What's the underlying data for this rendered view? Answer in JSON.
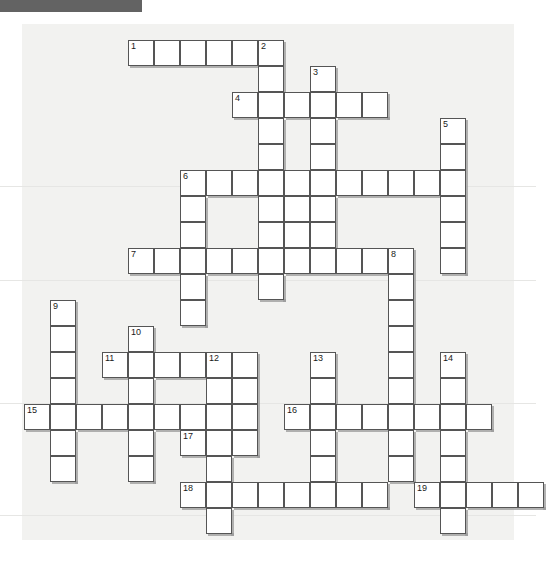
{
  "page": {
    "background_color": "#ffffff",
    "board_background_color": "#f2f2f0",
    "cell_fill_color": "#ffffff",
    "cell_border_color": "#555555",
    "header_bar_color": "#636363"
  },
  "grid": {
    "cell_size_px": 26,
    "origin_x_px": 24,
    "origin_y_px": 40,
    "columns": 20,
    "rows": 19,
    "total_clue_numbers": 19
  },
  "entries": [
    {
      "number": "1",
      "direction": "across",
      "col": 4,
      "row": 0,
      "length": 6
    },
    {
      "number": "2",
      "direction": "down",
      "col": 9,
      "row": 0,
      "length": 10
    },
    {
      "number": "3",
      "direction": "down",
      "col": 11,
      "row": 1,
      "length": 6
    },
    {
      "number": "4",
      "direction": "across",
      "col": 8,
      "row": 2,
      "length": 6
    },
    {
      "number": "5",
      "direction": "down",
      "col": 16,
      "row": 3,
      "length": 6
    },
    {
      "number": "6",
      "direction": "across",
      "col": 6,
      "row": 5,
      "length": 11
    },
    {
      "number": "7",
      "direction": "across",
      "col": 4,
      "row": 8,
      "length": 10
    },
    {
      "number": "8",
      "direction": "down",
      "col": 14,
      "row": 8,
      "length": 7
    },
    {
      "number": "9",
      "direction": "down",
      "col": 1,
      "row": 10,
      "length": 7
    },
    {
      "number": "10",
      "direction": "down",
      "col": 4,
      "row": 11,
      "length": 7
    },
    {
      "number": "11",
      "direction": "across",
      "col": 3,
      "row": 12,
      "length": 6
    },
    {
      "number": "12",
      "direction": "down",
      "col": 7,
      "row": 12,
      "length": 7
    },
    {
      "number": "13",
      "direction": "down",
      "col": 11,
      "row": 12,
      "length": 6
    },
    {
      "number": "14",
      "direction": "down",
      "col": 16,
      "row": 12,
      "length": 7
    },
    {
      "number": "15",
      "direction": "across",
      "col": 0,
      "row": 14,
      "length": 7
    },
    {
      "number": "16",
      "direction": "across",
      "col": 10,
      "row": 14,
      "length": 8
    },
    {
      "number": "17",
      "direction": "across",
      "col": 6,
      "row": 15,
      "length": 3
    },
    {
      "number": "18",
      "direction": "across",
      "col": 6,
      "row": 17,
      "length": 8
    },
    {
      "number": "19",
      "direction": "across",
      "col": 15,
      "row": 17,
      "length": 5
    }
  ],
  "cells": [
    {
      "col": 4,
      "row": 0,
      "num": "1"
    },
    {
      "col": 5,
      "row": 0
    },
    {
      "col": 6,
      "row": 0
    },
    {
      "col": 7,
      "row": 0
    },
    {
      "col": 8,
      "row": 0
    },
    {
      "col": 9,
      "row": 0,
      "num": "2"
    },
    {
      "col": 9,
      "row": 1
    },
    {
      "col": 11,
      "row": 1,
      "num": "3"
    },
    {
      "col": 8,
      "row": 2
    },
    {
      "col": 9,
      "row": 2
    },
    {
      "col": 10,
      "row": 2
    },
    {
      "col": 11,
      "row": 2
    },
    {
      "col": 12,
      "row": 2
    },
    {
      "col": 13,
      "row": 2
    },
    {
      "col": 8,
      "row": 2,
      "num": "4",
      "dup": true
    },
    {
      "col": 9,
      "row": 3
    },
    {
      "col": 11,
      "row": 3
    },
    {
      "col": 16,
      "row": 3,
      "num": "5"
    },
    {
      "col": 9,
      "row": 4
    },
    {
      "col": 11,
      "row": 4
    },
    {
      "col": 16,
      "row": 4
    },
    {
      "col": 6,
      "row": 5,
      "num": "6"
    },
    {
      "col": 7,
      "row": 5
    },
    {
      "col": 8,
      "row": 5
    },
    {
      "col": 9,
      "row": 5
    },
    {
      "col": 10,
      "row": 5
    },
    {
      "col": 11,
      "row": 5
    },
    {
      "col": 12,
      "row": 5
    },
    {
      "col": 13,
      "row": 5
    },
    {
      "col": 14,
      "row": 5
    },
    {
      "col": 15,
      "row": 5
    },
    {
      "col": 16,
      "row": 5
    },
    {
      "col": 6,
      "row": 6
    },
    {
      "col": 9,
      "row": 6
    },
    {
      "col": 10,
      "row": 6
    },
    {
      "col": 11,
      "row": 6
    },
    {
      "col": 16,
      "row": 6
    },
    {
      "col": 6,
      "row": 7
    },
    {
      "col": 9,
      "row": 7
    },
    {
      "col": 10,
      "row": 7
    },
    {
      "col": 11,
      "row": 7
    },
    {
      "col": 16,
      "row": 7
    },
    {
      "col": 4,
      "row": 8,
      "num": "7"
    },
    {
      "col": 5,
      "row": 8
    },
    {
      "col": 6,
      "row": 8
    },
    {
      "col": 7,
      "row": 8
    },
    {
      "col": 8,
      "row": 8
    },
    {
      "col": 9,
      "row": 8
    },
    {
      "col": 10,
      "row": 8
    },
    {
      "col": 11,
      "row": 8
    },
    {
      "col": 12,
      "row": 8
    },
    {
      "col": 13,
      "row": 8
    },
    {
      "col": 14,
      "row": 8,
      "num": "8"
    },
    {
      "col": 16,
      "row": 8
    },
    {
      "col": 6,
      "row": 9
    },
    {
      "col": 9,
      "row": 9
    },
    {
      "col": 14,
      "row": 9
    },
    {
      "col": 1,
      "row": 10,
      "num": "9"
    },
    {
      "col": 6,
      "row": 10
    },
    {
      "col": 14,
      "row": 10
    },
    {
      "col": 1,
      "row": 11
    },
    {
      "col": 4,
      "row": 11,
      "num": "10"
    },
    {
      "col": 14,
      "row": 11
    },
    {
      "col": 1,
      "row": 12
    },
    {
      "col": 3,
      "row": 12,
      "num": "11"
    },
    {
      "col": 4,
      "row": 12
    },
    {
      "col": 5,
      "row": 12
    },
    {
      "col": 6,
      "row": 12
    },
    {
      "col": 7,
      "row": 12,
      "num": "12"
    },
    {
      "col": 8,
      "row": 12
    },
    {
      "col": 11,
      "row": 12,
      "num": "13"
    },
    {
      "col": 14,
      "row": 12
    },
    {
      "col": 16,
      "row": 12,
      "num": "14"
    },
    {
      "col": 1,
      "row": 13
    },
    {
      "col": 4,
      "row": 13
    },
    {
      "col": 7,
      "row": 13
    },
    {
      "col": 8,
      "row": 13
    },
    {
      "col": 11,
      "row": 13
    },
    {
      "col": 14,
      "row": 13
    },
    {
      "col": 16,
      "row": 13
    },
    {
      "col": 0,
      "row": 14,
      "num": "15"
    },
    {
      "col": 1,
      "row": 14
    },
    {
      "col": 2,
      "row": 14
    },
    {
      "col": 3,
      "row": 14
    },
    {
      "col": 4,
      "row": 14
    },
    {
      "col": 5,
      "row": 14
    },
    {
      "col": 6,
      "row": 14
    },
    {
      "col": 7,
      "row": 14
    },
    {
      "col": 8,
      "row": 14
    },
    {
      "col": 10,
      "row": 14,
      "num": "16"
    },
    {
      "col": 11,
      "row": 14
    },
    {
      "col": 12,
      "row": 14
    },
    {
      "col": 13,
      "row": 14
    },
    {
      "col": 14,
      "row": 14
    },
    {
      "col": 15,
      "row": 14
    },
    {
      "col": 16,
      "row": 14
    },
    {
      "col": 17,
      "row": 14
    },
    {
      "col": 1,
      "row": 15
    },
    {
      "col": 4,
      "row": 15
    },
    {
      "col": 6,
      "row": 15,
      "num": "17"
    },
    {
      "col": 7,
      "row": 15
    },
    {
      "col": 8,
      "row": 15
    },
    {
      "col": 11,
      "row": 15
    },
    {
      "col": 14,
      "row": 15
    },
    {
      "col": 16,
      "row": 15
    },
    {
      "col": 1,
      "row": 16
    },
    {
      "col": 4,
      "row": 16
    },
    {
      "col": 7,
      "row": 16
    },
    {
      "col": 11,
      "row": 16
    },
    {
      "col": 14,
      "row": 16
    },
    {
      "col": 16,
      "row": 16
    },
    {
      "col": 6,
      "row": 17,
      "num": "18"
    },
    {
      "col": 7,
      "row": 17
    },
    {
      "col": 8,
      "row": 17
    },
    {
      "col": 9,
      "row": 17
    },
    {
      "col": 10,
      "row": 17
    },
    {
      "col": 11,
      "row": 17
    },
    {
      "col": 12,
      "row": 17
    },
    {
      "col": 13,
      "row": 17
    },
    {
      "col": 15,
      "row": 17,
      "num": "19"
    },
    {
      "col": 16,
      "row": 17
    },
    {
      "col": 17,
      "row": 17
    },
    {
      "col": 18,
      "row": 17
    },
    {
      "col": 19,
      "row": 17
    },
    {
      "col": 7,
      "row": 18
    },
    {
      "col": 16,
      "row": 18
    }
  ],
  "scanlines": [
    {
      "y": 186
    },
    {
      "y": 280
    },
    {
      "y": 403
    },
    {
      "y": 515
    }
  ]
}
